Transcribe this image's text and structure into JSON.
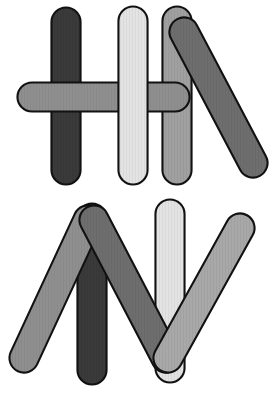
{
  "image": {
    "title": "Craft sticks arrangement",
    "width": 277,
    "height": 397,
    "background_color": "#ffffff",
    "outline_color": "#111111",
    "description": "Two groups of overlapping rounded popsicle sticks on a white background. The upper group forms an H-like shape with a leaning diagonal stick on the right; the lower group forms an N / M-like zigzag with two straight vertical sticks."
  },
  "palette": {
    "very_dark_gray": "#3a3a3a",
    "dark_gray": "#6e6e6e",
    "medium_gray": "#8f8f8f",
    "light_gray": "#a8a8a8",
    "very_light_gray": "#e3e3e3",
    "outline": "#111111"
  },
  "groups": [
    {
      "id": "upper-group",
      "label": "Upper arrangement",
      "shape_hint": "H with leaning diagonal",
      "sticks": [
        {
          "id": "upper-vertical-dark",
          "label": "Dark vertical stick (left)",
          "orientation": "vertical",
          "color": "#3a3a3a",
          "x1": 66,
          "y1": 22,
          "x2": 66,
          "y2": 170,
          "thickness": 27,
          "z": 1
        },
        {
          "id": "upper-vertical-light",
          "label": "Very light vertical stick (middle)",
          "orientation": "vertical",
          "color": "#e3e3e3",
          "x1": 133,
          "y1": 21,
          "x2": 133,
          "y2": 170,
          "thickness": 27,
          "z": 4
        },
        {
          "id": "upper-vertical-medium",
          "label": "Medium gray vertical stick (right)",
          "orientation": "vertical",
          "color": "#a0a0a0",
          "x1": 177,
          "y1": 21,
          "x2": 177,
          "y2": 170,
          "thickness": 27,
          "z": 2
        },
        {
          "id": "upper-horizontal",
          "label": "Gray horizontal cross stick",
          "orientation": "horizontal",
          "color": "#8f8f8f",
          "x1": 32,
          "y1": 97,
          "x2": 175,
          "y2": 97,
          "thickness": 27,
          "z": 3
        },
        {
          "id": "upper-diagonal",
          "label": "Dark gray leaning diagonal stick",
          "orientation": "diagonal",
          "color": "#6e6e6e",
          "x1": 184,
          "y1": 32,
          "x2": 253,
          "y2": 163,
          "thickness": 27,
          "z": 5
        }
      ]
    },
    {
      "id": "lower-group",
      "label": "Lower arrangement",
      "shape_hint": "N / zigzag with verticals",
      "sticks": [
        {
          "id": "lower-vertical-dark",
          "label": "Very dark vertical stick",
          "orientation": "vertical",
          "color": "#3a3a3a",
          "x1": 92,
          "y1": 218,
          "x2": 92,
          "y2": 370,
          "thickness": 27,
          "z": 2
        },
        {
          "id": "lower-vertical-light",
          "label": "Very light vertical stick",
          "orientation": "vertical",
          "color": "#e3e3e3",
          "x1": 170,
          "y1": 214,
          "x2": 170,
          "y2": 368,
          "thickness": 27,
          "z": 1
        },
        {
          "id": "lower-diagonal-left",
          "label": "Gray diagonal descending to lower-left",
          "orientation": "diagonal",
          "color": "#8f8f8f",
          "x1": 88,
          "y1": 220,
          "x2": 24,
          "y2": 358,
          "thickness": 27,
          "z": 3
        },
        {
          "id": "lower-diagonal-middle",
          "label": "Dark gray diagonal descending to lower-right",
          "orientation": "diagonal",
          "color": "#6e6e6e",
          "x1": 94,
          "y1": 220,
          "x2": 166,
          "y2": 358,
          "thickness": 27,
          "z": 4
        },
        {
          "id": "lower-diagonal-right",
          "label": "Light gray diagonal ascending to upper-right",
          "orientation": "diagonal",
          "color": "#a8a8a8",
          "x1": 168,
          "y1": 358,
          "x2": 240,
          "y2": 228,
          "thickness": 27,
          "z": 5
        }
      ]
    }
  ]
}
